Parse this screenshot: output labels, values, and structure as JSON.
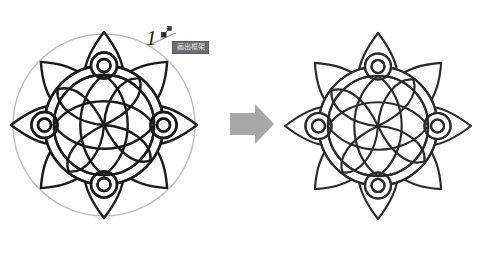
{
  "page": {
    "background_color": "#ffffff",
    "width": 496,
    "height": 253
  },
  "annotation": {
    "step_number": "1",
    "handle_icon": "move-handle-icon",
    "handle_superscript": "x"
  },
  "tooltip": {
    "text": "画出框架",
    "background_color": "#6e6e6e",
    "text_color": "#e8e8e8"
  },
  "arrow": {
    "icon": "right-arrow-icon",
    "color": "#a8a8a8",
    "direction": "right"
  },
  "figures": [
    {
      "id": "figure-before",
      "label": "mandala-with-guide-circle",
      "has_guide_circle": true,
      "guide_circle_color": "#bdbdbd",
      "stroke_color": "#1a1a1a",
      "petal_count": 8,
      "ring_node_count": 4,
      "inner_petal_count": 4
    },
    {
      "id": "figure-after",
      "label": "mandala-final",
      "has_guide_circle": false,
      "guide_circle_color": "#bdbdbd",
      "stroke_color": "#2a2a2a",
      "petal_count": 8,
      "ring_node_count": 4,
      "inner_petal_count": 4
    }
  ],
  "colors": {
    "ink": "#1a1a1a",
    "ink_light": "#2a2a2a",
    "guide": "#bdbdbd",
    "arrow": "#a8a8a8",
    "tooltip_bg": "#6e6e6e"
  }
}
